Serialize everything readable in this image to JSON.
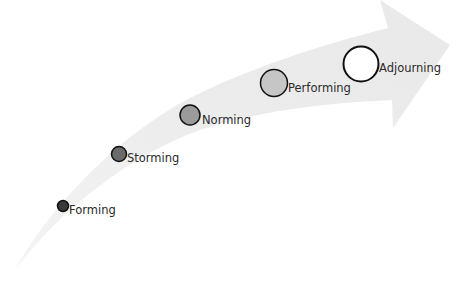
{
  "diagram": {
    "type": "curved-progress-arrow",
    "arrow_color": "#efefef",
    "stages": [
      {
        "label": "Forming",
        "fill": "#3a3a3a",
        "cx": 63,
        "cy": 206,
        "r": 5.5,
        "label_x": 69,
        "label_y": 209
      },
      {
        "label": "Storming",
        "fill": "#6b6b6b",
        "cx": 119,
        "cy": 154,
        "r": 7.5,
        "label_x": 127,
        "label_y": 157
      },
      {
        "label": "Norming",
        "fill": "#9b9b9b",
        "cx": 190,
        "cy": 115,
        "r": 10,
        "label_x": 202,
        "label_y": 119
      },
      {
        "label": "Performing",
        "fill": "#c6c6c6",
        "cx": 274,
        "cy": 83,
        "r": 13.5,
        "label_x": 288,
        "label_y": 87
      },
      {
        "label": "Adjourning",
        "fill": "#ffffff",
        "cx": 361,
        "cy": 64,
        "r": 17.5,
        "label_x": 379,
        "label_y": 67
      }
    ],
    "stroke_color": "#111111"
  }
}
